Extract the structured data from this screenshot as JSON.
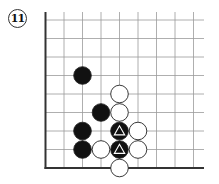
{
  "diagram": {
    "label": "11",
    "grid": {
      "columns": 9,
      "rows": 9,
      "edges": [
        "left",
        "bottom"
      ]
    },
    "stones": [
      {
        "color": "black",
        "col": 2,
        "row": 3,
        "marker": null
      },
      {
        "color": "white",
        "col": 4,
        "row": 4,
        "marker": null
      },
      {
        "color": "black",
        "col": 3,
        "row": 5,
        "marker": null
      },
      {
        "color": "white",
        "col": 4,
        "row": 5,
        "marker": null
      },
      {
        "color": "black",
        "col": 2,
        "row": 6,
        "marker": null
      },
      {
        "color": "black",
        "col": 4,
        "row": 6,
        "marker": "triangle"
      },
      {
        "color": "white",
        "col": 5,
        "row": 6,
        "marker": null
      },
      {
        "color": "black",
        "col": 2,
        "row": 7,
        "marker": null
      },
      {
        "color": "white",
        "col": 3,
        "row": 7,
        "marker": null
      },
      {
        "color": "black",
        "col": 4,
        "row": 7,
        "marker": "triangle"
      },
      {
        "color": "white",
        "col": 5,
        "row": 7,
        "marker": null
      },
      {
        "color": "white",
        "col": 4,
        "row": 8,
        "marker": null
      }
    ],
    "colors": {
      "black_stone": "#111111",
      "white_stone": "#ffffff",
      "line": "#9a9a9a",
      "edge": "#333333"
    }
  }
}
